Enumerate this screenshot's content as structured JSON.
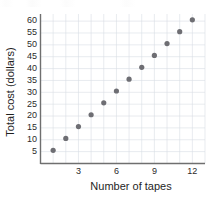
{
  "chart_data": {
    "type": "scatter",
    "title": "",
    "xlabel": "Number of tapes",
    "ylabel": "Total cost (dollars)",
    "x": [
      1,
      2,
      3,
      4,
      5,
      6,
      7,
      8,
      9,
      10,
      11,
      12
    ],
    "values": [
      5,
      10,
      15,
      20,
      25,
      30,
      35,
      40,
      45,
      50,
      55,
      60
    ],
    "series": [
      {
        "name": "Total cost",
        "points": [
          {
            "x": 1,
            "y": 5
          },
          {
            "x": 2,
            "y": 10
          },
          {
            "x": 3,
            "y": 15
          },
          {
            "x": 4,
            "y": 20
          },
          {
            "x": 5,
            "y": 25
          },
          {
            "x": 6,
            "y": 30
          },
          {
            "x": 7,
            "y": 35
          },
          {
            "x": 8,
            "y": 40
          },
          {
            "x": 9,
            "y": 45
          },
          {
            "x": 10,
            "y": 50
          },
          {
            "x": 11,
            "y": 55
          },
          {
            "x": 12,
            "y": 60
          }
        ]
      }
    ],
    "xticks": [
      3,
      6,
      9,
      12
    ],
    "xtick_labels": [
      "3",
      "6",
      "9",
      "12"
    ],
    "yticks": [
      5,
      10,
      15,
      20,
      25,
      30,
      35,
      40,
      45,
      50,
      55,
      60
    ],
    "ytick_labels": [
      "5",
      "10",
      "15",
      "20",
      "25",
      "30",
      "35",
      "40",
      "45",
      "50",
      "55",
      "60"
    ],
    "xlim": [
      0,
      13
    ],
    "ylim": [
      0,
      63
    ],
    "grid": true,
    "legend": false,
    "legend_position": "none",
    "marker": "circle",
    "marker_color": "#6e6e73",
    "grid_color": "#d9dde4",
    "axis_color": "#6f6f6f",
    "text_color": "#1f1f1f",
    "background": "#ffffff"
  },
  "axis_titles": {
    "x": "Number of tapes",
    "y": "Total cost (dollars)"
  }
}
